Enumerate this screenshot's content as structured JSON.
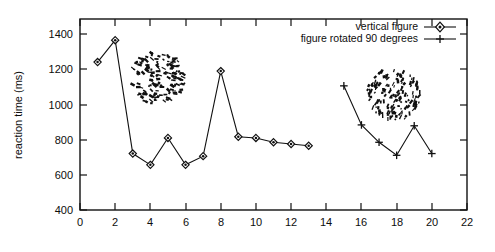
{
  "chart_data": {
    "type": "line",
    "title": "",
    "xlabel": "",
    "ylabel": "reaction time (ms)",
    "xlim": [
      0,
      22
    ],
    "ylim": [
      400,
      1500
    ],
    "xticks": [
      0,
      2,
      4,
      6,
      8,
      10,
      12,
      14,
      16,
      18,
      20,
      22
    ],
    "yticks": [
      400,
      600,
      800,
      1000,
      1200,
      1400
    ],
    "grid": false,
    "legend_position": "top-right",
    "series": [
      {
        "name": "vertical figure",
        "marker": "diamond",
        "x": [
          1,
          2,
          3,
          4,
          5,
          6,
          7,
          8,
          9,
          10,
          11,
          12,
          13
        ],
        "values": [
          1252,
          1378,
          725,
          660,
          815,
          660,
          710,
          1200,
          822,
          815,
          790,
          780,
          770
        ]
      },
      {
        "name": "figure rotated 90 degrees",
        "marker": "plus",
        "x": [
          15,
          16,
          17,
          18,
          19,
          20
        ],
        "values": [
          1115,
          890,
          790,
          715,
          885,
          725
        ]
      }
    ]
  },
  "legend": {
    "entries": [
      {
        "label": "vertical figure",
        "marker": "diamond"
      },
      {
        "label": "figure rotated 90 degrees",
        "marker": "plus"
      }
    ]
  },
  "axes": {
    "y_title": "reaction time (ms)",
    "y_tick_labels": [
      "1400",
      "1200",
      "1000",
      "800",
      "600",
      "400"
    ],
    "x_tick_labels": [
      "0",
      "2",
      "4",
      "6",
      "8",
      "10",
      "12",
      "14",
      "16",
      "18",
      "20",
      "22"
    ]
  },
  "illustrations": [
    {
      "name": "texture-blob-vertical",
      "orientation": "vertical"
    },
    {
      "name": "texture-blob-rotated",
      "orientation": "rotated-90"
    }
  ],
  "colors": {
    "ink": "#111111",
    "background": "#ffffff"
  }
}
